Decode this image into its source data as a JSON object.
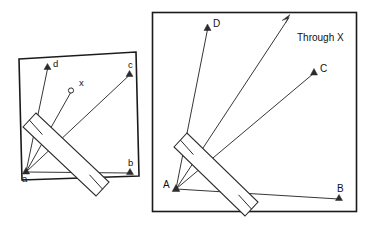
{
  "figure": {
    "background_color": "#ffffff",
    "line_color": "#2b2b2b",
    "frame_color": "#1a1a1a"
  },
  "left_panel": {
    "name": "left-diagram-panel",
    "frame": {
      "x": 18,
      "y": 55,
      "width": 118,
      "height": 122,
      "rotation_deg": -2.2
    },
    "vertex": {
      "label": "a",
      "marker": "triangle",
      "x": 26,
      "y": 172
    },
    "points": [
      {
        "label": "d",
        "marker": "triangle",
        "x": 48,
        "y": 66,
        "label_dx": 5,
        "label_dy": -1
      },
      {
        "label": "x",
        "marker": "circle",
        "x": 72,
        "y": 90,
        "label_dx": 7,
        "label_dy": -3
      },
      {
        "label": "c",
        "marker": "triangle",
        "x": 130,
        "y": 74,
        "label_dx": 1,
        "label_dy": -6
      },
      {
        "label": "b",
        "marker": "triangle",
        "x": 131,
        "y": 173,
        "label_dx": 1,
        "label_dy": -6
      }
    ]
  },
  "right_panel": {
    "name": "right-diagram-panel",
    "frame": {
      "x": 152,
      "y": 12,
      "width": 205,
      "height": 200,
      "rotation_deg": 0
    },
    "vertex": {
      "label": "A",
      "marker": "triangle",
      "x": 176,
      "y": 189
    },
    "points": [
      {
        "label": "D",
        "marker": "triangle",
        "x": 208,
        "y": 26,
        "label_dx": 5,
        "label_dy": -1
      },
      {
        "label": "C",
        "marker": "triangle",
        "x": 315,
        "y": 71,
        "label_dx": 5,
        "label_dy": -1
      },
      {
        "label": "B",
        "marker": "triangle",
        "x": 340,
        "y": 199,
        "label_dx": 1,
        "label_dy": -6
      }
    ],
    "annotation": {
      "label": "Through X",
      "marker": "arrow",
      "x": 299,
      "y": 38,
      "arrow_tip_x": 290,
      "arrow_tip_y": 16
    }
  }
}
